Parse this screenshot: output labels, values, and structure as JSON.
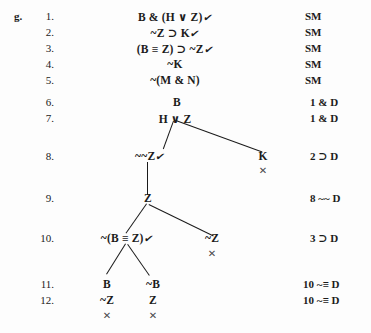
{
  "problem": {
    "letter": "g."
  },
  "glyphs": {
    "check": "✔",
    "closure": "✕"
  },
  "lines": [
    {
      "num": "1.",
      "justification": "SM"
    },
    {
      "num": "2.",
      "justification": "SM"
    },
    {
      "num": "3.",
      "justification": "SM"
    },
    {
      "num": "4.",
      "justification": "SM"
    },
    {
      "num": "5.",
      "justification": "SM"
    },
    {
      "num": "6.",
      "justification": "1  & D"
    },
    {
      "num": "7.",
      "justification": "1  & D"
    },
    {
      "num": "8.",
      "justification": "2  ⊃ D"
    },
    {
      "num": "9.",
      "justification": "8  ~~ D"
    },
    {
      "num": "10.",
      "justification": "3  ⊃ D"
    },
    {
      "num": "11.",
      "justification": "10  ~≡ D"
    },
    {
      "num": "12.",
      "justification": "10  ~≡ D"
    }
  ],
  "nodes": [
    {
      "id": "n1",
      "text": "B & (H ∨ Z)",
      "check": true
    },
    {
      "id": "n2",
      "text": "~Z ⊃ K",
      "check": true
    },
    {
      "id": "n3",
      "text": "(B ≡ Z) ⊃ ~Z",
      "check": true
    },
    {
      "id": "n4",
      "text": "~K",
      "check": false
    },
    {
      "id": "n5",
      "text": "~(M & N)",
      "check": false
    },
    {
      "id": "n6",
      "text": "B",
      "check": false
    },
    {
      "id": "n7",
      "text": "H ∨ Z",
      "check": false
    },
    {
      "id": "n8",
      "text": "~~Z",
      "check": true
    },
    {
      "id": "n8b",
      "text": "K",
      "check": false
    },
    {
      "id": "n9",
      "text": "Z",
      "check": false
    },
    {
      "id": "n10",
      "text": "~(B ≡ Z)",
      "check": true
    },
    {
      "id": "n10b",
      "text": "~Z",
      "check": false
    },
    {
      "id": "n11",
      "text": "B",
      "check": false
    },
    {
      "id": "n11b",
      "text": "~B",
      "check": false
    },
    {
      "id": "n12",
      "text": "~Z",
      "check": false
    },
    {
      "id": "n12b",
      "text": "Z",
      "check": false
    }
  ]
}
